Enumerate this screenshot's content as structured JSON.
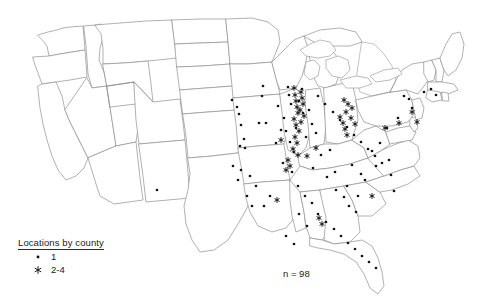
{
  "figure": {
    "type": "dot-density-map",
    "region": "United States",
    "background_color": "#ffffff",
    "border_color": "#8f8f8f",
    "marker_color": "#111111"
  },
  "legend": {
    "title": "Locations by county",
    "entries": [
      {
        "symbol": "dot",
        "label": "1"
      },
      {
        "symbol": "asterisk",
        "label": "2-4"
      }
    ]
  },
  "annotation": {
    "sample_size": "n = 98"
  },
  "chart_data": {
    "type": "scatter",
    "title": "Locations by county",
    "xlabel": "",
    "ylabel": "",
    "legend_position": "bottom-left",
    "grid": false,
    "series": [
      {
        "name": "1",
        "symbol": "dot",
        "points": [
          [
            157,
            190
          ],
          [
            263,
            86
          ],
          [
            262,
            96
          ],
          [
            259,
            123
          ],
          [
            266,
            123
          ],
          [
            232,
            100
          ],
          [
            237,
            107
          ],
          [
            239,
            114
          ],
          [
            241,
            125
          ],
          [
            244,
            139
          ],
          [
            240,
            146
          ],
          [
            245,
            148
          ],
          [
            276,
            143
          ],
          [
            281,
            130
          ],
          [
            288,
            87
          ],
          [
            289,
            95
          ],
          [
            291,
            104
          ],
          [
            286,
            131
          ],
          [
            290,
            142
          ],
          [
            294,
            152
          ],
          [
            283,
            163
          ],
          [
            299,
            101
          ],
          [
            303,
            113
          ],
          [
            309,
            110
          ],
          [
            312,
            124
          ],
          [
            306,
            137
          ],
          [
            316,
            133
          ],
          [
            321,
            155
          ],
          [
            313,
            168
          ],
          [
            330,
            150
          ],
          [
            327,
            177
          ],
          [
            335,
            172
          ],
          [
            336,
            190
          ],
          [
            344,
            197
          ],
          [
            347,
            186
          ],
          [
            352,
            165
          ],
          [
            349,
            206
          ],
          [
            356,
            212
          ],
          [
            358,
            196
          ],
          [
            361,
            174
          ],
          [
            365,
            180
          ],
          [
            372,
            151
          ],
          [
            376,
            166
          ],
          [
            380,
            143
          ],
          [
            387,
            128
          ],
          [
            389,
            160
          ],
          [
            391,
            175
          ],
          [
            394,
            191
          ],
          [
            398,
            118
          ],
          [
            404,
            96
          ],
          [
            409,
            99
          ],
          [
            412,
            108
          ],
          [
            424,
            92
          ],
          [
            431,
            89
          ],
          [
            436,
            95
          ],
          [
            292,
            172
          ],
          [
            298,
            186
          ],
          [
            305,
            196
          ],
          [
            312,
            203
          ],
          [
            318,
            214
          ],
          [
            326,
            222
          ],
          [
            334,
            229
          ],
          [
            341,
            236
          ],
          [
            348,
            243
          ],
          [
            355,
            249
          ],
          [
            362,
            256
          ],
          [
            369,
            262
          ],
          [
            376,
            268
          ],
          [
            299,
            214
          ],
          [
            307,
            226
          ],
          [
            286,
            236
          ],
          [
            294,
            244
          ],
          [
            270,
            196
          ],
          [
            264,
            206
          ],
          [
            256,
            186
          ],
          [
            250,
            176
          ],
          [
            247,
            196
          ],
          [
            252,
            206
          ],
          [
            241,
            170
          ],
          [
            238,
            180
          ],
          [
            233,
            166
          ],
          [
            278,
            106
          ],
          [
            284,
            118
          ],
          [
            296,
            128
          ],
          [
            302,
            89
          ],
          [
            318,
            96
          ],
          [
            325,
            104
          ],
          [
            333,
            112
          ],
          [
            340,
            120
          ],
          [
            347,
            127
          ],
          [
            354,
            135
          ],
          [
            361,
            142
          ],
          [
            368,
            149
          ],
          [
            375,
            156
          ],
          [
            382,
            163
          ]
        ]
      },
      {
        "name": "2-4",
        "symbol": "asterisk",
        "points": [
          [
            294,
            88
          ],
          [
            295,
            95
          ],
          [
            296,
            101
          ],
          [
            297,
            107
          ],
          [
            298,
            113
          ],
          [
            294,
            119
          ],
          [
            296,
            125
          ],
          [
            299,
            131
          ],
          [
            295,
            137
          ],
          [
            297,
            143
          ],
          [
            293,
            149
          ],
          [
            298,
            155
          ],
          [
            301,
            92
          ],
          [
            302,
            98
          ],
          [
            303,
            104
          ],
          [
            300,
            110
          ],
          [
            304,
            116
          ],
          [
            301,
            122
          ],
          [
            343,
            123
          ],
          [
            345,
            129
          ],
          [
            347,
            135
          ],
          [
            340,
            117
          ],
          [
            344,
            100
          ],
          [
            348,
            104
          ],
          [
            352,
            108
          ],
          [
            346,
            112
          ],
          [
            385,
            128
          ],
          [
            288,
            160
          ],
          [
            290,
            166
          ],
          [
            286,
            170
          ],
          [
            316,
            148
          ],
          [
            319,
            218
          ],
          [
            322,
            224
          ],
          [
            277,
            200
          ],
          [
            307,
            156
          ],
          [
            372,
            196
          ],
          [
            399,
            123
          ],
          [
            281,
            140
          ],
          [
            417,
            122
          ],
          [
            351,
            118
          ],
          [
            355,
            124
          ],
          [
            412,
            112
          ]
        ]
      }
    ],
    "totals": {
      "n": 98,
      "label": "n = 98"
    }
  }
}
